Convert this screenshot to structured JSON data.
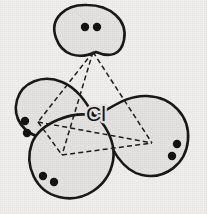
{
  "figure": {
    "kind": "orbital-diagram",
    "background_color": "#f0efed",
    "lobe_fill_color": "#e4e3e1",
    "outline_color": "#151515",
    "dot_color": "#101010",
    "dash_color": "#1a1a1a",
    "center_label": "Cl",
    "center": {
      "x": 96,
      "y": 113
    },
    "lobes": [
      {
        "id": "lobe-top",
        "name": "top-orbital-lobe",
        "direction": "up",
        "electron_pair_count": 2,
        "dots": [
          {
            "x": 85,
            "y": 27
          },
          {
            "x": 97,
            "y": 27
          }
        ]
      },
      {
        "id": "lobe-left",
        "name": "left-orbital-lobe",
        "direction": "left",
        "electron_pair_count": 2,
        "dots": [
          {
            "x": 25,
            "y": 121
          },
          {
            "x": 27,
            "y": 133
          }
        ]
      },
      {
        "id": "lobe-right",
        "name": "right-orbital-lobe",
        "direction": "right",
        "electron_pair_count": 2,
        "dots": [
          {
            "x": 177,
            "y": 144
          },
          {
            "x": 172,
            "y": 156
          }
        ]
      },
      {
        "id": "lobe-bottom",
        "name": "bottom-orbital-lobe",
        "direction": "down",
        "electron_pair_count": 2,
        "dots": [
          {
            "x": 43,
            "y": 176
          },
          {
            "x": 54,
            "y": 182
          }
        ]
      }
    ],
    "tetrahedron": {
      "name": "dashed-tetrahedron",
      "vertices": [
        {
          "id": "apex-top",
          "x": 93,
          "y": 52
        },
        {
          "id": "vertex-left",
          "x": 38,
          "y": 122
        },
        {
          "id": "vertex-front",
          "x": 62,
          "y": 155
        },
        {
          "id": "vertex-right",
          "x": 152,
          "y": 143
        }
      ],
      "edges": [
        [
          "apex-top",
          "vertex-left"
        ],
        [
          "apex-top",
          "vertex-front"
        ],
        [
          "apex-top",
          "vertex-right"
        ],
        [
          "vertex-left",
          "vertex-front"
        ],
        [
          "vertex-left",
          "vertex-right"
        ],
        [
          "vertex-front",
          "vertex-right"
        ]
      ]
    }
  }
}
